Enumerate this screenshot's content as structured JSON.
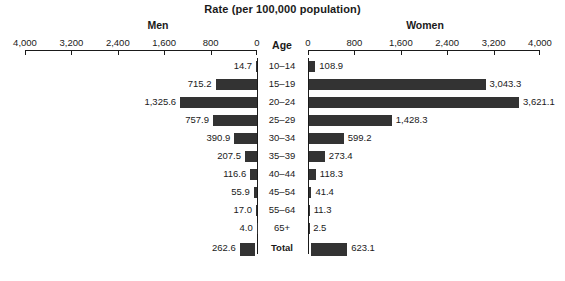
{
  "chart_data": {
    "type": "bar",
    "title": "Rate (per 100,000 population)",
    "subtype": "population-pyramid",
    "xlabel": "Rate (per 100,000 population)",
    "ylabel": "Age",
    "axis_heading": "Age",
    "left_heading": "Men",
    "right_heading": "Women",
    "xlim": [
      0,
      4000
    ],
    "grid": false,
    "legend": "none",
    "tick_values": [
      0,
      800,
      1600,
      2400,
      3200,
      4000
    ],
    "left_tick_labels": [
      "4,000",
      "3,200",
      "2,400",
      "1,600",
      "800",
      "0"
    ],
    "right_tick_labels": [
      "0",
      "800",
      "1,600",
      "2,400",
      "3,200",
      "4,000"
    ],
    "categories": [
      "10–14",
      "15–19",
      "20–24",
      "25–29",
      "30–34",
      "35–39",
      "40–44",
      "45–54",
      "55–64",
      "65+",
      "Total"
    ],
    "series": [
      {
        "name": "Men",
        "values": [
          14.7,
          715.2,
          1325.6,
          757.9,
          390.9,
          207.5,
          116.6,
          55.9,
          17.0,
          4.0,
          262.6
        ],
        "labels": [
          "14.7",
          "715.2",
          "1,325.6",
          "757.9",
          "390.9",
          "207.5",
          "116.6",
          "55.9",
          "17.0",
          "4.0",
          "262.6"
        ]
      },
      {
        "name": "Women",
        "values": [
          108.9,
          3043.3,
          3621.1,
          1428.3,
          599.2,
          273.4,
          118.3,
          41.4,
          11.3,
          2.5,
          623.1
        ],
        "labels": [
          "108.9",
          "3,043.3",
          "3,621.1",
          "1,428.3",
          "599.2",
          "273.4",
          "118.3",
          "41.4",
          "11.3",
          "2.5",
          "623.1"
        ]
      }
    ],
    "colors": {
      "bar": "#333333",
      "axis": "#1a1a1a",
      "background": "#ffffff",
      "text": "#1a1a1a"
    }
  }
}
